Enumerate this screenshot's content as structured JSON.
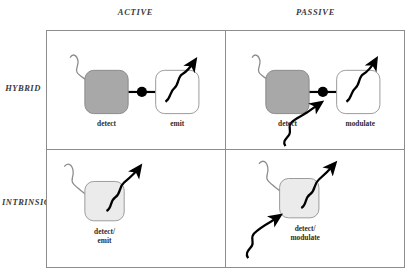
{
  "figure": {
    "type": "2x2-matrix-diagram",
    "columns": [
      {
        "id": "active",
        "label": "ACTIVE"
      },
      {
        "id": "passive",
        "label": "PASSIVE"
      }
    ],
    "rows": [
      {
        "id": "hybrid",
        "label": "HYBRID"
      },
      {
        "id": "intrinsic",
        "label": "INTRINSIC"
      }
    ],
    "colors": {
      "cell_border": "#8d8d8d",
      "detect_block_fill": "#a8a8a8",
      "detect_block_stroke": "#8a8a8a",
      "emit_block_fill": "#ffffff",
      "emit_block_stroke": "#9a9a9a",
      "intrinsic_block_fill": "#ebebeb",
      "intrinsic_block_stroke": "#9a9a9a",
      "incoming_wave": "#8c8c8c",
      "outgoing_wave": "#000000",
      "connector": "#000000",
      "text": "#2b2b2b",
      "background": "#ffffff"
    },
    "cells": [
      {
        "id": "hybrid-active",
        "row": "hybrid",
        "column": "active",
        "blocks": [
          {
            "id": "detect",
            "label": "detect",
            "style": "gray"
          },
          {
            "id": "emit",
            "label": "emit",
            "style": "white"
          }
        ],
        "connector": "link-with-node",
        "waves": [
          {
            "id": "incoming-signal",
            "color": "gray",
            "direction": "in-from-upper-left"
          },
          {
            "id": "outgoing-emission",
            "color": "black",
            "direction": "out-to-upper-right"
          }
        ]
      },
      {
        "id": "hybrid-passive",
        "row": "hybrid",
        "column": "passive",
        "blocks": [
          {
            "id": "detect",
            "label": "detect",
            "style": "gray"
          },
          {
            "id": "modulate",
            "label": "modulate",
            "style": "white"
          }
        ],
        "connector": "link-with-node",
        "waves": [
          {
            "id": "incoming-signal",
            "color": "gray",
            "direction": "in-from-upper-left"
          },
          {
            "id": "outgoing-modulated",
            "color": "black",
            "direction": "out-to-upper-right"
          },
          {
            "id": "incoming-carrier",
            "color": "black",
            "direction": "in-from-lower-left"
          }
        ]
      },
      {
        "id": "intrinsic-active",
        "row": "intrinsic",
        "column": "active",
        "blocks": [
          {
            "id": "detect-emit",
            "label": "detect/\nemit",
            "style": "light"
          }
        ],
        "connector": "none",
        "waves": [
          {
            "id": "incoming-signal",
            "color": "gray",
            "direction": "in-from-upper-left"
          },
          {
            "id": "outgoing-emission",
            "color": "black",
            "direction": "out-to-upper-right"
          }
        ]
      },
      {
        "id": "intrinsic-passive",
        "row": "intrinsic",
        "column": "passive",
        "blocks": [
          {
            "id": "detect-modulate",
            "label": "detect/\nmodulate",
            "style": "light"
          }
        ],
        "connector": "none",
        "waves": [
          {
            "id": "incoming-signal",
            "color": "gray",
            "direction": "in-from-upper-left"
          },
          {
            "id": "outgoing-modulated",
            "color": "black",
            "direction": "out-to-upper-right"
          },
          {
            "id": "incoming-carrier",
            "color": "black",
            "direction": "in-from-lower-left"
          }
        ]
      }
    ],
    "labels": {
      "detect": "detect",
      "emit": "emit",
      "modulate": "modulate",
      "detect_emit_line1": "detect/",
      "detect_emit_line2": "emit",
      "detect_modulate_line1": "detect/",
      "detect_modulate_line2": "modulate"
    }
  }
}
